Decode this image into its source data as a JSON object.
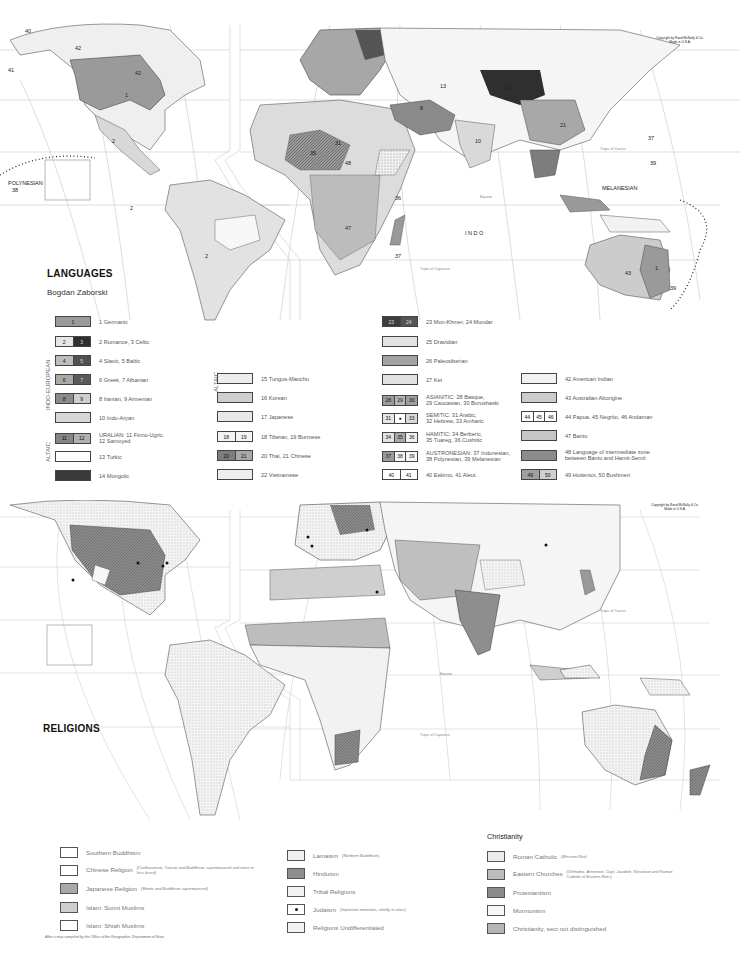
{
  "languages_map": {
    "title": "LANGUAGES",
    "author": "Bogdan Zaborski",
    "copyright": [
      "Copyright by Rand McNally & Co.",
      "Made in U.S.A."
    ],
    "map_labels": [
      "40",
      "41",
      "42",
      "1",
      "2",
      "POLYNESIAN",
      "38",
      "MELANESIAN",
      "39",
      "37",
      "INDO",
      "13",
      "14",
      "15",
      "16",
      "21",
      "25",
      "10",
      "31",
      "34",
      "35",
      "48",
      "47",
      "36",
      "33",
      "32",
      "8",
      "26",
      "43",
      "45",
      "44",
      "49",
      "50",
      "Tropic of Cancer",
      "Tropic of Capricorn",
      "Equator"
    ],
    "group_labels": {
      "indo_european": "INDO-EUROPEAN",
      "altaic_left": "ALTAIC",
      "altaic_mid": "ALTAIC"
    },
    "legend": [
      {
        "cells": [
          "1"
        ],
        "colors": [
          "#9a9a9a"
        ],
        "label": "1  Germanic"
      },
      {
        "cells": [
          "2",
          "3"
        ],
        "colors": [
          "#e6e6e6",
          "#2f2f2f"
        ],
        "label": "2 Romance, 3 Celtic"
      },
      {
        "cells": [
          "4",
          "5"
        ],
        "colors": [
          "#bdbdbd",
          "#505050"
        ],
        "label": "4 Slavic, 5 Baltic"
      },
      {
        "cells": [
          "6",
          "7"
        ],
        "colors": [
          "#a9a9a9",
          "#5a5a5a"
        ],
        "label": "6 Greek,  7 Albanian"
      },
      {
        "cells": [
          "8",
          "9"
        ],
        "colors": [
          "#8a8a8a",
          "#cfcfcf"
        ],
        "label": "8 Iranian,  9 Armenian"
      },
      {
        "cells": [
          ""
        ],
        "colors": [
          "#d6d6d6"
        ],
        "label": "10 Indo-Aryan"
      },
      {
        "cells": [
          "11",
          "12"
        ],
        "colors": [
          "#858585",
          "#b0b0b0"
        ],
        "label": "URALIAN:  11 Finno-Ugric,\n12 Samoyed"
      },
      {
        "cells": [
          ""
        ],
        "colors": [
          "#ffffff"
        ],
        "label": "13 Turkic"
      },
      {
        "cells": [
          ""
        ],
        "colors": [
          "#3a3a3a"
        ],
        "label": "14 Mongolic"
      },
      {
        "cells": [
          ""
        ],
        "colors": [
          "#ededed"
        ],
        "label": "15 Tungus-Manchu"
      },
      {
        "cells": [
          ""
        ],
        "colors": [
          "#cfcfcf"
        ],
        "label": "16 Korean"
      },
      {
        "cells": [
          ""
        ],
        "colors": [
          "#e8e8e8"
        ],
        "label": "17 Japanese"
      },
      {
        "cells": [
          "18",
          "19"
        ],
        "colors": [
          "#f4f4f4",
          "#f4f4f4"
        ],
        "label": "18 Tibetan, 19 Burmese"
      },
      {
        "cells": [
          "20",
          "21"
        ],
        "colors": [
          "#7d7d7d",
          "#a8a8a8"
        ],
        "label": "20 Thai,  21 Chinese"
      },
      {
        "cells": [
          ""
        ],
        "colors": [
          "#eeeeee"
        ],
        "label": "22 Vietnamese"
      },
      {
        "cells": [
          "23",
          "24"
        ],
        "colors": [
          "#3d3d3d",
          "#555555"
        ],
        "label": "23 Mon-Khmer,  24 Mundar"
      },
      {
        "cells": [
          ""
        ],
        "colors": [
          "#e3e3e3"
        ],
        "label": "25 Dravidian"
      },
      {
        "cells": [
          ""
        ],
        "colors": [
          "#a3a3a3"
        ],
        "label": "26 Paleosiberian"
      },
      {
        "cells": [
          ""
        ],
        "colors": [
          "#e2e2e2"
        ],
        "label": "27 Ket"
      },
      {
        "cells": [
          "28",
          "29",
          "30"
        ],
        "colors": [
          "#9a9a9a",
          "#b5b5b5",
          "#9d9d9d"
        ],
        "label": "ASIANITIC:  28 Basque,\n29 Caucasian, 30 Burushaski"
      },
      {
        "cells": [
          "31",
          "●",
          "33"
        ],
        "colors": [
          "#e6e6e6",
          "#ffffff",
          "#d9d9d9"
        ],
        "label": "SEMITIC:  31 Arabic,\n32 Hebrew,  33 Amharic"
      },
      {
        "cells": [
          "34",
          "35",
          "36"
        ],
        "colors": [
          "#e3e3e3",
          "#a9a9a9",
          "#f0f0f0"
        ],
        "label": "HAMITIC: 34 Berberic,\n35 Tuareg,  36 Cushitic"
      },
      {
        "cells": [
          "37",
          "38",
          "39"
        ],
        "colors": [
          "#9a9a9a",
          "#f5f5f5",
          "#f5f5f5"
        ],
        "label": "AUSTRONESIAN: 37 Indonesian,\n38 Polynesian,  39 Melanesian"
      },
      {
        "cells": [
          "40",
          "41"
        ],
        "colors": [
          "#ffffff",
          "#ffffff"
        ],
        "label": "40 Eskimo,  41 Aleut"
      },
      {
        "cells": [
          ""
        ],
        "colors": [
          "#f2f2f2"
        ],
        "label": "42 American Indian"
      },
      {
        "cells": [
          ""
        ],
        "colors": [
          "#cccccc"
        ],
        "label": "43 Australian Aborigine"
      },
      {
        "cells": [
          "44",
          "45",
          "46"
        ],
        "colors": [
          "#ffffff",
          "#ffffff",
          "#ffffff"
        ],
        "label": "44 Papua,  45 Negrito,  46 Andaman"
      },
      {
        "cells": [
          ""
        ],
        "colors": [
          "#c6c6c6"
        ],
        "label": "47 Bantu"
      },
      {
        "cells": [
          ""
        ],
        "colors": [
          "#8c8c8c"
        ],
        "label": "48 Language of intermediate zone\nbetween Bantu and Hamit-Semit"
      },
      {
        "cells": [
          "49",
          "50"
        ],
        "colors": [
          "#a0a0a0",
          "#cfcfcf"
        ],
        "label": "49 Hottentot,  50 Bushmen"
      }
    ]
  },
  "religions_map": {
    "title": "RELIGIONS",
    "copyright": [
      "Copyright by Rand McNally & Co.",
      "Made in U.S.A."
    ],
    "map_labels": [
      "Tropic of Cancer",
      "Tropic of Capricorn",
      "Equator"
    ],
    "legend_col1": [
      {
        "label": "Southern Buddhism",
        "note": "",
        "color": "#ffffff"
      },
      {
        "label": "Chinese Religion",
        "note": "(Confucianism, Taoism and Buddhism, superimposed and more or less fused)",
        "color": "#ffffff"
      },
      {
        "label": "Japanese Religion",
        "note": "(Shinto and Buddhism superimposed)",
        "color": "#a8a8a8"
      },
      {
        "label": "Islam: Sunni Muslims",
        "note": "",
        "color": "#cfcfcf"
      },
      {
        "label": "Islam: Shiah Muslims",
        "note": "",
        "color": "#ffffff"
      }
    ],
    "legend_col2": [
      {
        "label": "Lamaism",
        "note": "(Northern Buddhism)",
        "color": "#f0f0f0"
      },
      {
        "label": "Hinduism",
        "note": "",
        "color": "#8e8e8e"
      },
      {
        "label": "Tribal Religions",
        "note": "",
        "color": "#f2f2f2"
      },
      {
        "label": "Judaism",
        "note": "(Important minorities, chiefly in cities)",
        "color": "#ffffff"
      },
      {
        "label": "Religions Undifferentiated",
        "note": "",
        "color": "#f3f3f3"
      }
    ],
    "christianity": {
      "heading": "Christianity",
      "items": [
        {
          "label": "Roman Catholic",
          "note": "(Western Rite)",
          "color": "#ececec"
        },
        {
          "label": "Eastern Churches",
          "note": "(Orthodox, Armenian, Copt, Jacobite, Nestorian and Roman Catholic of Eastern Rites)",
          "color": "#bdbdbd"
        },
        {
          "label": "Protestantism",
          "note": "",
          "color": "#8a8a8a"
        },
        {
          "label": "Mormonism",
          "note": "",
          "color": "#f7f7f7"
        },
        {
          "label": "Christianity, sect not distinguished",
          "note": "",
          "color": "#b5b5b5"
        }
      ]
    },
    "footnote": "After a map compiled by the Office of the Geographer, Department of State"
  }
}
